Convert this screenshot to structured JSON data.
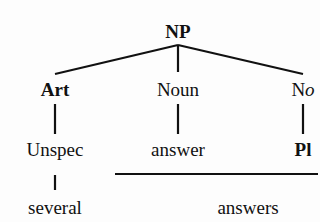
{
  "tree": {
    "root": {
      "label": "NP"
    },
    "level1": [
      {
        "label": "Art",
        "italic_suffix": ""
      },
      {
        "label": "Noun",
        "italic_suffix": ""
      },
      {
        "label": "N",
        "italic_suffix": "o"
      }
    ],
    "level2": [
      {
        "label": "Unspec"
      },
      {
        "label": "answer"
      },
      {
        "label": "Pl"
      }
    ],
    "surface": [
      {
        "label": "several"
      },
      {
        "label": "answers"
      }
    ]
  }
}
